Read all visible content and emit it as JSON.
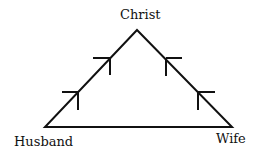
{
  "diagram": {
    "type": "triangle",
    "nodes": [
      {
        "id": "apex",
        "label": "Christ"
      },
      {
        "id": "left",
        "label": "Husband"
      },
      {
        "id": "right",
        "label": "Wife"
      }
    ],
    "edges": [
      {
        "from": "left",
        "to": "apex",
        "direction": "upward arrows"
      },
      {
        "from": "right",
        "to": "apex",
        "direction": "upward arrows"
      },
      {
        "from": "left",
        "to": "right",
        "direction": "none"
      }
    ],
    "colors": {
      "line": "#111111",
      "background": "#ffffff"
    }
  }
}
